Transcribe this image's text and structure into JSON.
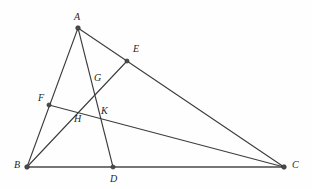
{
  "figure": {
    "width": 312,
    "height": 189,
    "background_color": "#fefefe",
    "line_color": "#3c3c3c",
    "base_line_color": "#4a4a4a",
    "dot_color": "#4a4a4a",
    "label_color": "#1e1e1e"
  },
  "points": [
    {
      "id": "A",
      "label": "A",
      "x": 78,
      "y": 28,
      "label_x": 74,
      "label_y": 12,
      "kind": "vertex"
    },
    {
      "id": "B",
      "label": "B",
      "x": 27,
      "y": 167,
      "label_x": 14,
      "label_y": 160,
      "kind": "vertex"
    },
    {
      "id": "C",
      "label": "C",
      "x": 284,
      "y": 167,
      "label_x": 292,
      "label_y": 160,
      "kind": "vertex"
    },
    {
      "id": "D",
      "label": "D",
      "x": 113,
      "y": 167,
      "label_x": 110,
      "label_y": 174,
      "kind": "point-on-side"
    },
    {
      "id": "E",
      "label": "E",
      "x": 127,
      "y": 61,
      "label_x": 133,
      "label_y": 44,
      "kind": "point-on-side"
    },
    {
      "id": "F",
      "label": "F",
      "x": 49,
      "y": 105,
      "label_x": 38,
      "label_y": 93,
      "kind": "point-on-side"
    },
    {
      "id": "G",
      "label": "G",
      "x": 98,
      "y": 89,
      "label_x": 94,
      "label_y": 73,
      "kind": "intersection"
    },
    {
      "id": "H",
      "label": "H",
      "x": 80,
      "y": 112,
      "label_x": 74,
      "label_y": 114,
      "kind": "intersection"
    },
    {
      "id": "K",
      "label": "K",
      "x": 105,
      "y": 119,
      "label_x": 101,
      "label_y": 106,
      "kind": "intersection"
    }
  ],
  "segments": [
    {
      "id": "AB",
      "from": "A",
      "to": "B",
      "style": "thin",
      "description": "side AB through F"
    },
    {
      "id": "AC",
      "from": "A",
      "to": "C",
      "style": "thin",
      "description": "side AC through E"
    },
    {
      "id": "BC",
      "from": "B",
      "to": "C",
      "style": "base",
      "description": "base BC through D"
    },
    {
      "id": "AD",
      "from": "A",
      "to": "D",
      "style": "thin",
      "description": "cevian from A to D through G and K"
    },
    {
      "id": "BE",
      "from": "B",
      "to": "E",
      "style": "thin",
      "description": "cevian from B to E through H and G"
    },
    {
      "id": "FC",
      "from": "F",
      "to": "C",
      "style": "thin",
      "description": "cevian from F to C through H and K"
    }
  ]
}
